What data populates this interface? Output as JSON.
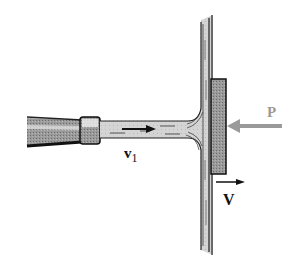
{
  "diagram": {
    "labels": {
      "jet_velocity": "v",
      "jet_velocity_subscript": "1",
      "plate_velocity": "V",
      "force": "P"
    },
    "colors": {
      "background": "#ffffff",
      "outline": "#1a1a1a",
      "water": "#cfcfcf",
      "plate": "#8a8a8a",
      "force_arrow": "#9a9a9a",
      "velocity_arrow": "#111111"
    }
  }
}
